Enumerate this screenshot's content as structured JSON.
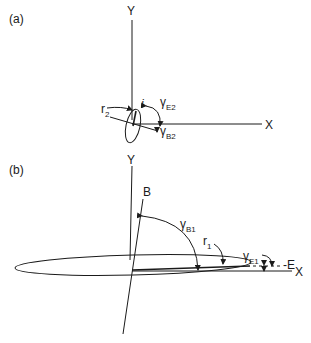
{
  "panel_a": {
    "label": "(a)",
    "y_axis": "Y",
    "x_axis": "X",
    "r_label": "r",
    "r_sub": "2",
    "i_label": "i",
    "gamma_e": "γ",
    "gamma_e_sub": "E2",
    "gamma_b": "γ",
    "gamma_b_sub": "B2"
  },
  "panel_b": {
    "label": "(b)",
    "y_axis": "Y",
    "x_axis": "X",
    "b_label": "B",
    "e_label": "-E",
    "r_label": "r",
    "r_sub": "1",
    "gamma_b": "γ",
    "gamma_b_sub": "B1",
    "gamma_e": "γ",
    "gamma_e_sub": "E1"
  }
}
